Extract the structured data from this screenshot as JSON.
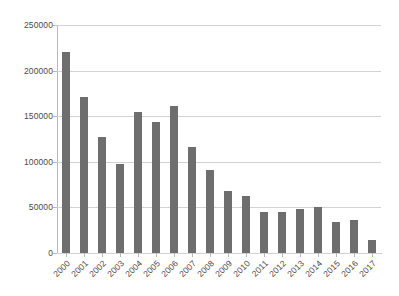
{
  "chart_data": {
    "type": "bar",
    "title": "",
    "xlabel": "",
    "ylabel": "",
    "ylim": [
      0,
      250000
    ],
    "grid": true,
    "legend": "none",
    "bar_color": "#6e6e6e",
    "gridline_color": "#d3d3d3",
    "axis_color": "#b8b8b8",
    "yticks": [
      250000,
      200000,
      150000,
      100000,
      50000,
      0
    ],
    "ytick_labels": [
      "250000",
      "200000",
      "150000",
      "100000",
      "50000",
      "0"
    ],
    "categories": [
      "2000",
      "2001",
      "2002",
      "2003",
      "2004",
      "2005",
      "2006",
      "2007",
      "2008",
      "2009",
      "2010",
      "2011",
      "2012",
      "2013",
      "2014",
      "2015",
      "2016",
      "2017"
    ],
    "values": [
      220000,
      171000,
      127000,
      98000,
      155000,
      144000,
      161000,
      116000,
      91000,
      68000,
      63000,
      45000,
      45000,
      48000,
      51000,
      34000,
      36000,
      14000
    ]
  }
}
